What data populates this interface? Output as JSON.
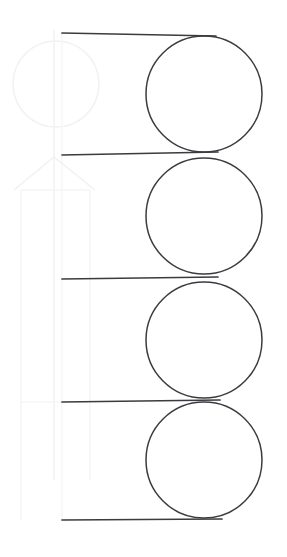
{
  "canvas": {
    "width": 287,
    "height": 557,
    "background_color": "#ffffff",
    "title": "Line drawing sketch"
  },
  "palette": {
    "stroke_dark": "#3c3c40",
    "stroke_ghost": "#f2f2f4",
    "stroke_ghost_soft": "#f7f7f8",
    "background": "#ffffff"
  },
  "strokes": {
    "dark_width": 1.6,
    "circle_width": 1.5,
    "ghost_width": 1.4
  },
  "chart_data": {
    "type": "scatter",
    "xlabel": "",
    "ylabel": "",
    "xlim": [
      0,
      287
    ],
    "ylim": [
      0,
      557
    ],
    "grid": false,
    "legend": "none",
    "annotations": [
      "four stacked tangent circles on the right",
      "five horizontal rules on the left",
      "faint ghost construction: circle, arrowhead and vertical shaft"
    ]
  },
  "circles": [
    {
      "name": "circle-1",
      "cx": 204,
      "cy": 94,
      "r": 58
    },
    {
      "name": "circle-2",
      "cx": 204,
      "cy": 216,
      "r": 58
    },
    {
      "name": "circle-3",
      "cx": 204,
      "cy": 340,
      "r": 58
    },
    {
      "name": "circle-4",
      "cx": 204,
      "cy": 460,
      "r": 58
    }
  ],
  "rules": [
    {
      "name": "rule-1",
      "x1": 62,
      "y1": 33,
      "x2": 216,
      "y2": 36
    },
    {
      "name": "rule-2",
      "x1": 62,
      "y1": 155,
      "x2": 218,
      "y2": 152
    },
    {
      "name": "rule-3",
      "x1": 62,
      "y1": 279,
      "x2": 218,
      "y2": 277
    },
    {
      "name": "rule-4",
      "x1": 62,
      "y1": 402,
      "x2": 220,
      "y2": 400
    },
    {
      "name": "rule-5",
      "x1": 62,
      "y1": 520,
      "x2": 222,
      "y2": 519
    }
  ],
  "ghost": {
    "circle": {
      "cx": 56,
      "cy": 84,
      "r": 43
    },
    "arrow_head": {
      "apex_x": 54,
      "apex_y": 157,
      "left_x": 14,
      "right_x": 95,
      "base_y": 190
    },
    "shaft_lines": [
      {
        "name": "ghost-shaft-left",
        "x": 21,
        "y1": 190,
        "y2": 520
      },
      {
        "name": "ghost-shaft-center",
        "x": 54,
        "y1": 30,
        "y2": 480
      },
      {
        "name": "ghost-shaft-right",
        "x": 90,
        "y1": 190,
        "y2": 480
      }
    ],
    "cross_lines": [
      {
        "name": "ghost-cross-top",
        "x1": 21,
        "y1": 190,
        "x2": 90,
        "y2": 190
      },
      {
        "name": "ghost-cross-bottom",
        "x1": 21,
        "y1": 402,
        "x2": 90,
        "y2": 402
      }
    ],
    "margin_line": {
      "name": "ghost-margin",
      "x": 62,
      "y1": 33,
      "y2": 520
    }
  }
}
